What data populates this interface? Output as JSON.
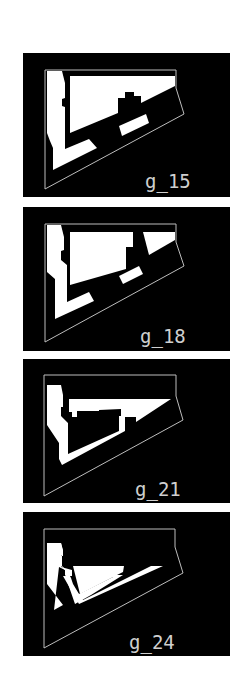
{
  "figure": {
    "panels": [
      {
        "label": "g_15"
      },
      {
        "label": "g_18"
      },
      {
        "label": "g_21"
      },
      {
        "label": "g_24"
      }
    ],
    "colors": {
      "background": "#000000",
      "outline": "#bdbdbd",
      "fill": "#ffffff",
      "label": "#cfcfcf",
      "page": "#ffffff"
    }
  }
}
